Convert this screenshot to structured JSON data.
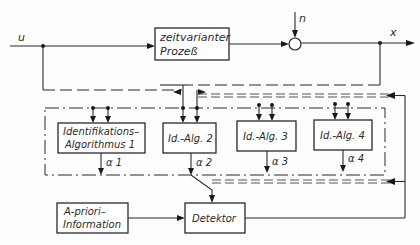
{
  "diagram": {
    "type": "block-diagram",
    "signals": {
      "input": "u",
      "noise": "n",
      "output": "x",
      "alpha1": "α 1",
      "alpha2": "α 2",
      "alpha3": "α 3",
      "alpha4": "α 4"
    },
    "blocks": {
      "process": {
        "line1": "zeitvarianter",
        "line2": "Prozeß"
      },
      "id_alg_1": {
        "line1": "Identifikations–",
        "line2": "Algorithmus  1"
      },
      "id_alg_2": {
        "label": "Id.-Alg. 2"
      },
      "id_alg_3": {
        "label": "Id.-Alg. 3"
      },
      "id_alg_4": {
        "label": "Id.-Alg. 4"
      },
      "a_priori": {
        "line1": "A-priori–",
        "line2": "Information"
      },
      "detektor": {
        "label": "Detektor"
      }
    },
    "elements": {
      "summing_junction": "summing-junction",
      "frame": "dash-dot identification group frame",
      "upper_bus": "double dashed parameter bus (upper)",
      "lower_bus": "double dashed parameter bus (lower)"
    },
    "colors": {
      "ink": "#2a2a2a",
      "paper": "#fdfdfd"
    }
  }
}
